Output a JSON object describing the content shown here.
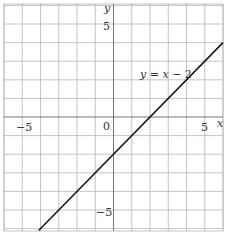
{
  "chart_data": {
    "type": "line",
    "title": "",
    "xlabel": "x",
    "ylabel": "y",
    "xlim": [
      -6,
      6
    ],
    "ylim": [
      -6.1,
      6.1
    ],
    "grid": true,
    "grid_step": 1,
    "x_ticks": [
      {
        "value": -5,
        "label": "−5"
      },
      {
        "value": 0,
        "label": "0"
      },
      {
        "value": 5,
        "label": "5"
      }
    ],
    "y_ticks": [
      {
        "value": 5,
        "label": "5"
      },
      {
        "value": -5,
        "label": "−5"
      }
    ],
    "series": [
      {
        "name": "y = x − 2",
        "equation": "y = x - 2",
        "x": [
          -4.1,
          6
        ],
        "y": [
          -6.1,
          4
        ]
      }
    ],
    "annotations": [
      {
        "text": "y = x − 2",
        "x": 3.2,
        "y": 2.1
      }
    ],
    "colors": {
      "grid": "#b5b5b5",
      "axis": "#777777",
      "line": "#1a1a1a",
      "text": "#333333"
    }
  },
  "labels": {
    "x_axis": "x",
    "y_axis": "y",
    "origin": "0",
    "x_neg5": "−5",
    "x_pos5": "5",
    "y_pos5": "5",
    "y_neg5": "−5",
    "equation_lhs": "y",
    "equation_eq": " = ",
    "equation_x": "x",
    "equation_rest": " − 2"
  }
}
